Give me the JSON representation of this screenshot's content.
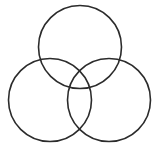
{
  "diagram": {
    "type": "venn",
    "sets": 3,
    "stroke_color": "#2b2b2b",
    "stroke_width": 1.6,
    "fill": "none",
    "background": "#ffffff",
    "circles": [
      {
        "id": "top",
        "cx": 80,
        "cy": 47,
        "r": 41.5
      },
      {
        "id": "left",
        "cx": 50,
        "cy": 100,
        "r": 41.5
      },
      {
        "id": "right",
        "cx": 109,
        "cy": 100,
        "r": 41.5
      }
    ]
  }
}
